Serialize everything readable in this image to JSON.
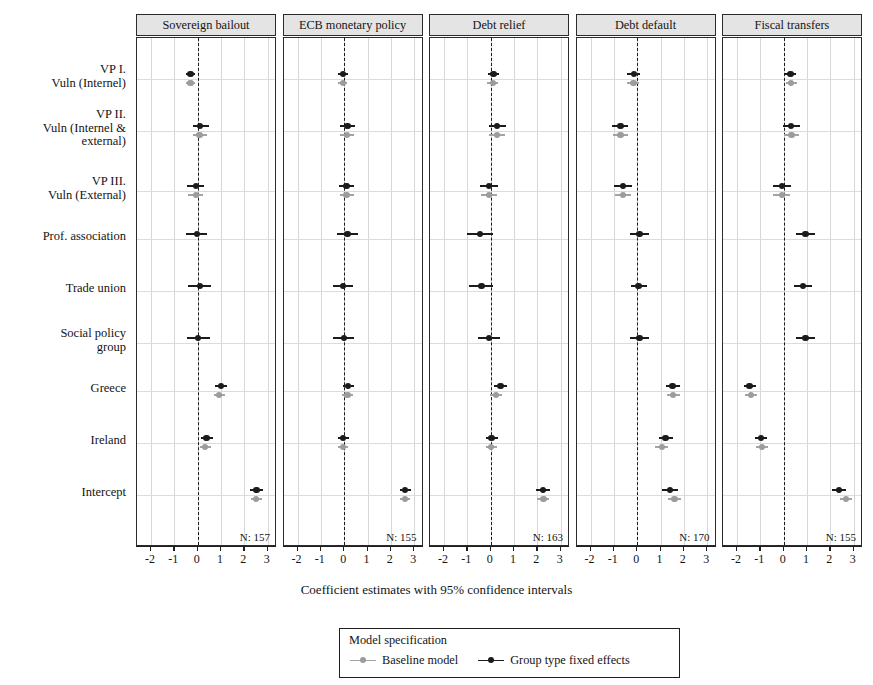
{
  "chart_data": {
    "type": "scatter",
    "subtype": "coefficient-plot-faceted",
    "title": "",
    "xlabel": "Coefficient estimates with 95% confidence intervals",
    "ylabel": "",
    "xlim": [
      -2.6,
      3.4
    ],
    "xticks": [
      -2,
      -1,
      0,
      1,
      2,
      3
    ],
    "xticklabels": [
      "-2",
      "-1",
      "0",
      "1",
      "2",
      "3"
    ],
    "grid": true,
    "zero_reference_line": 0,
    "legend": {
      "position": "bottom",
      "title": "Model specification",
      "entries": [
        {
          "name": "Baseline model",
          "color": "#9c9c9c"
        },
        {
          "name": "Group type fixed effects",
          "color": "#1b1b1b"
        }
      ]
    },
    "terms": [
      "VP I.\nVuln (Internel)",
      "VP II.\nVuln (Internel &\nexternal)",
      "VP III.\nVuln (External)",
      "Prof. association",
      "Trade union",
      "Social policy\ngroup",
      "Greece",
      "Ireland",
      "Intercept"
    ],
    "panels": [
      {
        "title": "Sovereign bailout",
        "n_label": "N: 157",
        "series": [
          {
            "name": "Group type fixed effects",
            "color": "#1b1b1b",
            "points": [
              {
                "term": "VP I.",
                "estimate": -0.3,
                "low": -0.52,
                "high": -0.1
              },
              {
                "term": "VP II.",
                "estimate": 0.1,
                "low": -0.22,
                "high": 0.48
              },
              {
                "term": "VP III.",
                "estimate": -0.06,
                "low": -0.44,
                "high": 0.26
              },
              {
                "term": "Prof. association",
                "estimate": -0.02,
                "low": -0.5,
                "high": 0.42
              },
              {
                "term": "Trade union",
                "estimate": 0.1,
                "low": -0.4,
                "high": 0.58
              },
              {
                "term": "Social policy group",
                "estimate": 0.02,
                "low": -0.46,
                "high": 0.52
              },
              {
                "term": "Greece",
                "estimate": 1.0,
                "low": 0.76,
                "high": 1.24
              },
              {
                "term": "Ireland",
                "estimate": 0.38,
                "low": 0.14,
                "high": 0.66
              },
              {
                "term": "Intercept",
                "estimate": 2.52,
                "low": 2.26,
                "high": 2.8
              }
            ]
          },
          {
            "name": "Baseline model",
            "color": "#9c9c9c",
            "points": [
              {
                "term": "VP I.",
                "estimate": -0.3,
                "low": -0.52,
                "high": -0.1
              },
              {
                "term": "VP II.",
                "estimate": 0.08,
                "low": -0.22,
                "high": 0.42
              },
              {
                "term": "VP III.",
                "estimate": -0.08,
                "low": -0.42,
                "high": 0.22
              },
              {
                "term": "Greece",
                "estimate": 0.92,
                "low": 0.7,
                "high": 1.16
              },
              {
                "term": "Ireland",
                "estimate": 0.32,
                "low": 0.1,
                "high": 0.58
              },
              {
                "term": "Intercept",
                "estimate": 2.5,
                "low": 2.28,
                "high": 2.74
              }
            ]
          }
        ]
      },
      {
        "title": "ECB monetary policy",
        "n_label": "N: 155",
        "series": [
          {
            "name": "Group type fixed effects",
            "color": "#1b1b1b",
            "points": [
              {
                "term": "VP I.",
                "estimate": -0.04,
                "low": -0.26,
                "high": 0.16
              },
              {
                "term": "VP II.",
                "estimate": 0.14,
                "low": -0.2,
                "high": 0.48
              },
              {
                "term": "VP III.",
                "estimate": 0.1,
                "low": -0.22,
                "high": 0.44
              },
              {
                "term": "Prof. association",
                "estimate": 0.14,
                "low": -0.32,
                "high": 0.6
              },
              {
                "term": "Trade union",
                "estimate": -0.04,
                "low": -0.48,
                "high": 0.4
              },
              {
                "term": "Social policy group",
                "estimate": -0.02,
                "low": -0.48,
                "high": 0.44
              },
              {
                "term": "Greece",
                "estimate": 0.16,
                "low": -0.06,
                "high": 0.42
              },
              {
                "term": "Ireland",
                "estimate": -0.04,
                "low": -0.26,
                "high": 0.2
              },
              {
                "term": "Intercept",
                "estimate": 2.62,
                "low": 2.38,
                "high": 2.86
              }
            ]
          },
          {
            "name": "Baseline model",
            "color": "#9c9c9c",
            "points": [
              {
                "term": "VP I.",
                "estimate": -0.06,
                "low": -0.26,
                "high": 0.14
              },
              {
                "term": "VP II.",
                "estimate": 0.12,
                "low": -0.18,
                "high": 0.44
              },
              {
                "term": "VP III.",
                "estimate": 0.1,
                "low": -0.2,
                "high": 0.42
              },
              {
                "term": "Greece",
                "estimate": 0.14,
                "low": -0.08,
                "high": 0.38
              },
              {
                "term": "Ireland",
                "estimate": -0.06,
                "low": -0.28,
                "high": 0.16
              },
              {
                "term": "Intercept",
                "estimate": 2.62,
                "low": 2.4,
                "high": 2.84
              }
            ]
          }
        ]
      },
      {
        "title": "Debt relief",
        "n_label": "N: 163",
        "series": [
          {
            "name": "Group type fixed effects",
            "color": "#1b1b1b",
            "points": [
              {
                "term": "VP I.",
                "estimate": 0.12,
                "low": -0.12,
                "high": 0.34
              },
              {
                "term": "VP II.",
                "estimate": 0.28,
                "low": -0.06,
                "high": 0.64
              },
              {
                "term": "VP III.",
                "estimate": -0.06,
                "low": -0.44,
                "high": 0.3
              },
              {
                "term": "Prof. association",
                "estimate": -0.46,
                "low": -1.02,
                "high": 0.1
              },
              {
                "term": "Trade union",
                "estimate": -0.4,
                "low": -0.92,
                "high": 0.12
              },
              {
                "term": "Social policy group",
                "estimate": -0.06,
                "low": -0.54,
                "high": 0.42
              },
              {
                "term": "Greece",
                "estimate": 0.42,
                "low": 0.16,
                "high": 0.7
              },
              {
                "term": "Ireland",
                "estimate": 0.04,
                "low": -0.2,
                "high": 0.3
              },
              {
                "term": "Intercept",
                "estimate": 2.24,
                "low": 1.96,
                "high": 2.54
              }
            ]
          },
          {
            "name": "Baseline model",
            "color": "#9c9c9c",
            "points": [
              {
                "term": "VP I.",
                "estimate": 0.1,
                "low": -0.14,
                "high": 0.32
              },
              {
                "term": "VP II.",
                "estimate": 0.26,
                "low": -0.06,
                "high": 0.6
              },
              {
                "term": "VP III.",
                "estimate": -0.06,
                "low": -0.4,
                "high": 0.28
              },
              {
                "term": "Greece",
                "estimate": 0.22,
                "low": -0.04,
                "high": 0.48
              },
              {
                "term": "Ireland",
                "estimate": 0.02,
                "low": -0.22,
                "high": 0.26
              },
              {
                "term": "Intercept",
                "estimate": 2.26,
                "low": 2.0,
                "high": 2.52
              }
            ]
          }
        ]
      },
      {
        "title": "Debt default",
        "n_label": "N: 170",
        "series": [
          {
            "name": "Group type fixed effects",
            "color": "#1b1b1b",
            "points": [
              {
                "term": "VP I.",
                "estimate": -0.14,
                "low": -0.42,
                "high": 0.12
              },
              {
                "term": "VP II.",
                "estimate": -0.72,
                "low": -1.06,
                "high": -0.38
              },
              {
                "term": "VP III.",
                "estimate": -0.6,
                "low": -0.98,
                "high": -0.22
              },
              {
                "term": "Prof. association",
                "estimate": 0.1,
                "low": -0.3,
                "high": 0.5
              },
              {
                "term": "Trade union",
                "estimate": 0.06,
                "low": -0.26,
                "high": 0.42
              },
              {
                "term": "Social policy group",
                "estimate": 0.1,
                "low": -0.3,
                "high": 0.5
              },
              {
                "term": "Greece",
                "estimate": 1.52,
                "low": 1.22,
                "high": 1.84
              },
              {
                "term": "Ireland",
                "estimate": 1.22,
                "low": 0.94,
                "high": 1.52
              },
              {
                "term": "Intercept",
                "estimate": 1.4,
                "low": 1.08,
                "high": 1.74
              }
            ]
          },
          {
            "name": "Baseline model",
            "color": "#9c9c9c",
            "points": [
              {
                "term": "VP I.",
                "estimate": -0.16,
                "low": -0.42,
                "high": 0.1
              },
              {
                "term": "VP II.",
                "estimate": -0.72,
                "low": -1.04,
                "high": -0.4
              },
              {
                "term": "VP III.",
                "estimate": -0.62,
                "low": -0.96,
                "high": -0.26
              },
              {
                "term": "Greece",
                "estimate": 1.54,
                "low": 1.26,
                "high": 1.84
              },
              {
                "term": "Ireland",
                "estimate": 1.06,
                "low": 0.78,
                "high": 1.34
              },
              {
                "term": "Intercept",
                "estimate": 1.6,
                "low": 1.32,
                "high": 1.9
              }
            ]
          }
        ]
      },
      {
        "title": "Fiscal transfers",
        "n_label": "N: 155",
        "series": [
          {
            "name": "Group type fixed effects",
            "color": "#1b1b1b",
            "points": [
              {
                "term": "VP I.",
                "estimate": 0.3,
                "low": 0.06,
                "high": 0.54
              },
              {
                "term": "VP II.",
                "estimate": 0.32,
                "low": -0.04,
                "high": 0.68
              },
              {
                "term": "VP III.",
                "estimate": -0.06,
                "low": -0.46,
                "high": 0.32
              },
              {
                "term": "Prof. association",
                "estimate": 0.94,
                "low": 0.52,
                "high": 1.34
              },
              {
                "term": "Trade union",
                "estimate": 0.82,
                "low": 0.46,
                "high": 1.2
              },
              {
                "term": "Social policy group",
                "estimate": 0.94,
                "low": 0.52,
                "high": 1.34
              },
              {
                "term": "Greece",
                "estimate": -1.46,
                "low": -1.72,
                "high": -1.18
              },
              {
                "term": "Ireland",
                "estimate": -0.96,
                "low": -1.22,
                "high": -0.7
              },
              {
                "term": "Intercept",
                "estimate": 2.38,
                "low": 2.08,
                "high": 2.68
              }
            ]
          },
          {
            "name": "Baseline model",
            "color": "#9c9c9c",
            "points": [
              {
                "term": "VP I.",
                "estimate": 0.32,
                "low": 0.1,
                "high": 0.56
              },
              {
                "term": "VP II.",
                "estimate": 0.34,
                "low": 0.02,
                "high": 0.66
              },
              {
                "term": "VP III.",
                "estimate": -0.08,
                "low": -0.46,
                "high": 0.28
              },
              {
                "term": "Greece",
                "estimate": -1.4,
                "low": -1.66,
                "high": -1.14
              },
              {
                "term": "Ireland",
                "estimate": -0.94,
                "low": -1.2,
                "high": -0.68
              },
              {
                "term": "Intercept",
                "estimate": 2.66,
                "low": 2.4,
                "high": 2.92
              }
            ]
          }
        ]
      }
    ]
  }
}
